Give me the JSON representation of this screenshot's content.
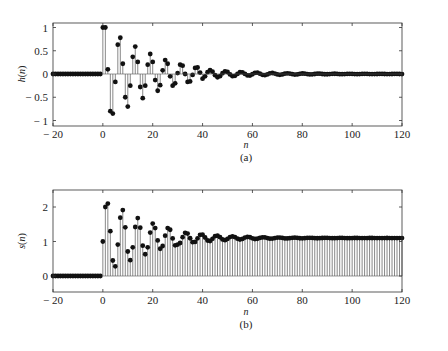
{
  "figure": {
    "width": 448,
    "height": 351,
    "background": "#ffffff",
    "ink_color": "#111111",
    "stem_color": "#555555"
  },
  "chart_data": [
    {
      "type": "stem",
      "panel": "(a)",
      "title": "",
      "xlabel": "n",
      "ylabel": "h(n)",
      "caption": "(a)",
      "xlim": [
        -20,
        120
      ],
      "ylim": [
        -1.05,
        1.1
      ],
      "xticks": [
        -20,
        0,
        20,
        40,
        60,
        80,
        100,
        120
      ],
      "xtick_labels": [
        "-20",
        "0",
        "20",
        "40",
        "60",
        "80",
        "100",
        "120"
      ],
      "yticks": [
        -1,
        -0.5,
        0,
        0.5,
        1
      ],
      "ytick_labels": [
        "-1",
        "-0.5",
        "0",
        "0.5",
        "1"
      ],
      "grid": false,
      "marker": "filled-circle",
      "x_start": -20,
      "x_end": 120,
      "values_note": "h(n)=0 for n<0; decaying oscillation for n>=0",
      "x": [
        0,
        1,
        2,
        3,
        4,
        5,
        6,
        7,
        8,
        9,
        10,
        11,
        12,
        13,
        14,
        15,
        16,
        17,
        18,
        19,
        20,
        21,
        22,
        23,
        24,
        25,
        26,
        27,
        28,
        29,
        30,
        31,
        32,
        33,
        34,
        35,
        36,
        37,
        38,
        39,
        40
      ],
      "values": [
        1,
        1,
        0.1,
        -0.8,
        -0.85,
        -0.17,
        0.63,
        0.78,
        0.22,
        -0.5,
        -0.7,
        -0.25,
        0.37,
        0.59,
        0.26,
        -0.28,
        -0.52,
        -0.25,
        0.2,
        0.43,
        0.26,
        -0.13,
        -0.36,
        -0.24,
        0.08,
        0.3,
        0.22,
        -0.05,
        -0.25,
        -0.2,
        0.02,
        0.2,
        0.18,
        0.0,
        -0.17,
        -0.16,
        -0.02,
        0.13,
        0.14,
        0.03,
        -0.1
      ]
    },
    {
      "type": "stem",
      "panel": "(b)",
      "title": "",
      "xlabel": "n",
      "ylabel": "s(n)",
      "caption": "(b)",
      "xlim": [
        -20,
        120
      ],
      "ylim": [
        -0.5,
        2.5
      ],
      "xticks": [
        -20,
        0,
        20,
        40,
        60,
        80,
        100,
        120
      ],
      "xtick_labels": [
        "-20",
        "0",
        "20",
        "40",
        "60",
        "80",
        "100",
        "120"
      ],
      "yticks": [
        0,
        1,
        2
      ],
      "ytick_labels": [
        "0",
        "1",
        "2"
      ],
      "grid": false,
      "marker": "filled-circle",
      "x_start": -20,
      "x_end": 120,
      "steady_state": 1.1,
      "values_note": "s(n)=0 for n<0; step response settling to ~1.1",
      "x": [
        0,
        1,
        2,
        3,
        4,
        5,
        6,
        7,
        8,
        9,
        10,
        11,
        12,
        13,
        14,
        15,
        16,
        17,
        18,
        19,
        20,
        21,
        22,
        23,
        24,
        25,
        26,
        27,
        28,
        29,
        30
      ],
      "values": [
        1,
        2,
        2.1,
        1.3,
        0.45,
        0.28,
        0.91,
        1.69,
        1.91,
        1.41,
        0.71,
        0.46,
        0.83,
        1.42,
        1.68,
        1.4,
        0.88,
        0.63,
        0.83,
        1.26,
        1.52,
        1.39,
        1.03,
        0.79,
        0.87,
        1.17,
        1.39,
        1.34,
        1.09,
        0.89,
        0.91
      ]
    }
  ],
  "panels": {
    "a": {
      "caption": "(a)",
      "xlabel": "n",
      "ylabel_fn": "h",
      "ylabel_arg": "n"
    },
    "b": {
      "caption": "(b)",
      "xlabel": "n",
      "ylabel_fn": "s",
      "ylabel_arg": "n"
    }
  }
}
